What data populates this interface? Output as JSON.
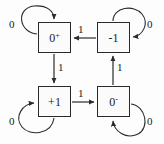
{
  "diagram": {
    "stroke_color": "#2a2a2a",
    "node_fill": "#fbfbfb",
    "background": "#fdfdfd",
    "states": [
      {
        "id": "zero-plus",
        "base": "0",
        "sup": "+",
        "x": 38,
        "y": 22,
        "w": 33,
        "h": 31
      },
      {
        "id": "minus-one",
        "base": "-1",
        "sup": "",
        "x": 97,
        "y": 22,
        "w": 33,
        "h": 31
      },
      {
        "id": "plus-one",
        "base": "+1",
        "sup": "",
        "x": 38,
        "y": 86,
        "w": 33,
        "h": 31
      },
      {
        "id": "zero-minus",
        "base": "0",
        "sup": "-",
        "x": 97,
        "y": 86,
        "w": 33,
        "h": 31
      }
    ],
    "transitions": [
      {
        "id": "minus-one-to-zero-plus",
        "from": "minus-one",
        "to": "zero-plus",
        "label": "1",
        "lx": 78,
        "ly": 24
      },
      {
        "id": "zero-plus-to-plus-one",
        "from": "zero-plus",
        "to": "plus-one",
        "label": "1",
        "lx": 58,
        "ly": 62
      },
      {
        "id": "plus-one-to-zero-minus",
        "from": "plus-one",
        "to": "zero-minus",
        "label": "1",
        "lx": 78,
        "ly": 88
      },
      {
        "id": "zero-minus-to-minus-one",
        "from": "zero-minus",
        "to": "minus-one",
        "label": "1",
        "lx": 117,
        "ly": 62
      }
    ],
    "self_loops": [
      {
        "id": "loop-zero-plus",
        "state": "zero-plus",
        "label": "0",
        "lx": 9,
        "ly": 19
      },
      {
        "id": "loop-minus-one",
        "state": "minus-one",
        "label": "0",
        "lx": 147,
        "ly": 19
      },
      {
        "id": "loop-plus-one",
        "state": "plus-one",
        "label": "0",
        "lx": 9,
        "ly": 116
      },
      {
        "id": "loop-zero-minus",
        "state": "zero-minus",
        "label": "0",
        "lx": 147,
        "ly": 116
      }
    ]
  }
}
